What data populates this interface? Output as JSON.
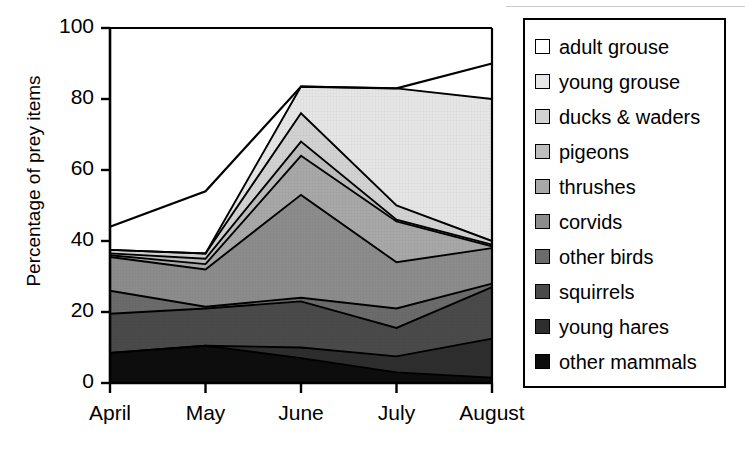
{
  "chart_data": {
    "type": "area",
    "stacked": true,
    "title": "",
    "xlabel": "",
    "ylabel": "Percentage of prey items",
    "categories": [
      "April",
      "May",
      "June",
      "July",
      "August"
    ],
    "x_tick_labels": [
      "April",
      "May",
      "June",
      "July",
      "August"
    ],
    "y_tick_labels": [
      "0",
      "20",
      "40",
      "60",
      "80",
      "100"
    ],
    "y_ticks": [
      0,
      20,
      40,
      60,
      80,
      100
    ],
    "ylim": [
      0,
      100
    ],
    "grid": false,
    "legend_position": "right",
    "series": [
      {
        "name": "other mammals",
        "color": "#0d0d0d",
        "values": [
          8.5,
          10.5,
          7.0,
          3.0,
          1.5
        ]
      },
      {
        "name": "young hares",
        "color": "#2e2e2e",
        "values": [
          0.0,
          0.0,
          3.0,
          4.5,
          11.0
        ]
      },
      {
        "name": "squirrels",
        "color": "#4a4a4a",
        "values": [
          11.0,
          10.5,
          13.0,
          8.0,
          14.5
        ]
      },
      {
        "name": "other birds",
        "color": "#6b6b6b",
        "values": [
          6.5,
          0.5,
          1.0,
          5.5,
          1.0
        ]
      },
      {
        "name": "corvids",
        "color": "#8c8c8c",
        "values": [
          9.5,
          10.5,
          29.0,
          13.0,
          10.0
        ]
      },
      {
        "name": "thrushes",
        "color": "#a8a8a8",
        "values": [
          0.5,
          1.5,
          11.0,
          11.5,
          0.5
        ]
      },
      {
        "name": "pigeons",
        "color": "#bdbdbd",
        "values": [
          0.5,
          1.5,
          4.0,
          0.5,
          0.5
        ]
      },
      {
        "name": "ducks & waders",
        "color": "#d2d2d2",
        "values": [
          1.0,
          1.5,
          8.0,
          4.0,
          1.0
        ]
      },
      {
        "name": "young grouse",
        "color": "#e6e6e6",
        "values": [
          0.0,
          0.0,
          7.5,
          33.0,
          40.0
        ]
      },
      {
        "name": "adult grouse",
        "color": "#ffffff",
        "values": [
          6.5,
          17.5,
          0.0,
          0.0,
          10.0
        ]
      }
    ],
    "cumulative_tops": {
      "April": [
        8.5,
        8.5,
        19.5,
        26.0,
        35.5,
        36.0,
        36.5,
        37.5,
        37.5,
        43.0
      ],
      "May": [
        10.5,
        10.5,
        21.0,
        21.5,
        32.0,
        33.5,
        35.0,
        36.5,
        36.5,
        54.0
      ],
      "June": [
        7.0,
        10.0,
        23.0,
        24.0,
        53.0,
        64.0,
        68.0,
        76.0,
        83.5,
        83.5
      ],
      "July": [
        3.0,
        7.5,
        15.5,
        21.0,
        34.0,
        45.5,
        46.0,
        50.0,
        83.0,
        83.0
      ],
      "August": [
        1.5,
        12.5,
        27.0,
        28.0,
        38.0,
        38.5,
        39.0,
        40.0,
        80.0,
        90.0
      ]
    },
    "totals": [
      43.0,
      54.0,
      83.5,
      83.0,
      90.0
    ]
  },
  "legend": {
    "items": [
      {
        "label": "adult grouse",
        "swatch": "#ffffff"
      },
      {
        "label": "young grouse",
        "swatch": "#e6e6e6"
      },
      {
        "label": "ducks & waders",
        "swatch": "#d2d2d2"
      },
      {
        "label": "pigeons",
        "swatch": "#bdbdbd"
      },
      {
        "label": "thrushes",
        "swatch": "#a8a8a8"
      },
      {
        "label": "corvids",
        "swatch": "#8c8c8c"
      },
      {
        "label": "other birds",
        "swatch": "#6b6b6b"
      },
      {
        "label": "squirrels",
        "swatch": "#4a4a4a"
      },
      {
        "label": "young hares",
        "swatch": "#2e2e2e"
      },
      {
        "label": "other mammals",
        "swatch": "#0d0d0d"
      }
    ]
  }
}
